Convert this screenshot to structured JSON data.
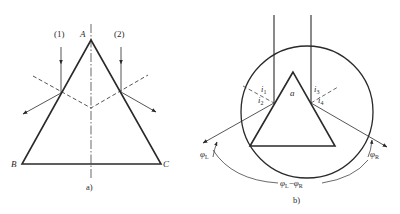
{
  "panel_a": {
    "caption": "a)",
    "vertices": {
      "apex": "A",
      "bottom_left": "B",
      "bottom_right": "C"
    },
    "rays": [
      {
        "label": "(1)"
      },
      {
        "label": "(2)"
      }
    ]
  },
  "panel_b": {
    "caption": "b)",
    "apex_angle": "a",
    "incidence_angles": {
      "left_in": "i",
      "left_in_sub": "1",
      "left_out": "i",
      "left_out_sub": "2",
      "right_in": "i",
      "right_in_sub": "3",
      "right_out": "i",
      "right_out_sub": "4"
    },
    "deviation_left": {
      "symbol": "φ",
      "sub": "L"
    },
    "deviation_right": {
      "symbol": "φ",
      "sub": "R"
    },
    "difference": {
      "left": "φ",
      "left_sub": "L",
      "minus": "−",
      "right": "φ",
      "right_sub": "R"
    }
  },
  "colors": {
    "line": "#2a2a2a",
    "background": "#ffffff"
  }
}
